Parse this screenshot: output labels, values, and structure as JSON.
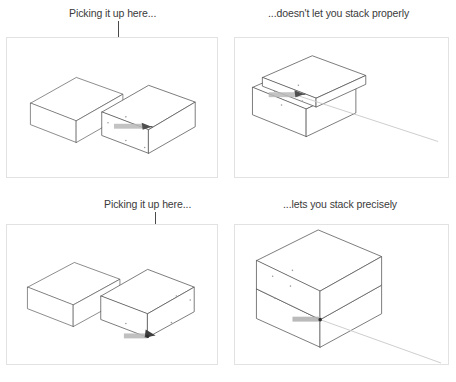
{
  "figure": {
    "panel_border_color": "#e2e2e2",
    "line_color": "#555555",
    "leader_color": "#4a4a4a",
    "caption_color": "#3a3a3a",
    "highlight_color": "#888888"
  },
  "captions": {
    "top_left": "Picking it up here...",
    "top_right": "...doesn't let you stack properly",
    "bottom_left": "Picking it up here...",
    "bottom_right": "...lets you stack precisely"
  },
  "panels": [
    {
      "id": "top-left",
      "name": "two-boxes-grab-on-face",
      "description": "Two rectangular boxes side by side in isometric view; a vertical leader line points to the middle of the front face of the right box.",
      "boxes": 2,
      "grab_point": "center of front face",
      "tooltip_label": "On Face in Group"
    },
    {
      "id": "top-right",
      "name": "boxes-misaligned-stack",
      "description": "Upper box resting offset on top of lower box, not aligned; inference line extends to the right.",
      "boxes": 2,
      "result": "misaligned",
      "tooltip_label": "On Face in Group"
    },
    {
      "id": "bottom-left",
      "name": "two-boxes-grab-on-corner",
      "description": "Two rectangular boxes side by side in isometric view; a vertical leader line points to the bottom front corner of the right box.",
      "boxes": 2,
      "grab_point": "bottom front corner",
      "tooltip_label": "Endpoint in Group"
    },
    {
      "id": "bottom-right",
      "name": "boxes-precise-stack",
      "description": "Upper box stacked exactly aligned on the lower box; inference line extends to the lower right.",
      "boxes": 2,
      "result": "aligned",
      "tooltip_label": "Endpoint in Group"
    }
  ]
}
